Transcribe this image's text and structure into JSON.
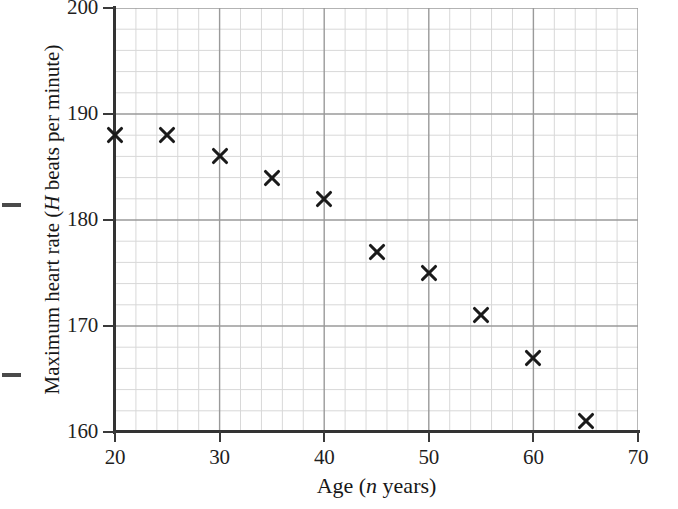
{
  "chart_data": {
    "type": "scatter",
    "title": "",
    "xlabel": "Age (n years)",
    "xlabel_parts": {
      "pre": "Age (",
      "italic": "n",
      "post": " years)"
    },
    "ylabel": "Maximum heart rate (H beats per minute)",
    "ylabel_parts": {
      "pre": "Maximum heart rate (",
      "italic": "H",
      "post": " beats per minute)"
    },
    "xlim": [
      20,
      70
    ],
    "ylim": [
      160,
      200
    ],
    "x_major_ticks": [
      20,
      30,
      40,
      50,
      60,
      70
    ],
    "y_major_ticks": [
      160,
      170,
      180,
      190,
      200
    ],
    "x_minor_step": 2,
    "y_minor_step": 2,
    "grid": true,
    "grid_major_color": "#9a9a9a",
    "grid_minor_color": "#d8d8d8",
    "marker": "x",
    "marker_color": "#1a1a1a",
    "x": [
      20,
      25,
      30,
      35,
      40,
      45,
      50,
      55,
      60,
      65
    ],
    "y": [
      188,
      188,
      186,
      184,
      182,
      177,
      175,
      171,
      167,
      161
    ],
    "points": [
      {
        "n": 20,
        "H": 188
      },
      {
        "n": 25,
        "H": 188
      },
      {
        "n": 30,
        "H": 186
      },
      {
        "n": 35,
        "H": 184
      },
      {
        "n": 40,
        "H": 182
      },
      {
        "n": 45,
        "H": 177
      },
      {
        "n": 50,
        "H": 175
      },
      {
        "n": 55,
        "H": 171
      },
      {
        "n": 60,
        "H": 167
      },
      {
        "n": 65,
        "H": 161
      }
    ],
    "legend": [],
    "legend_position": "none"
  },
  "axes": {
    "x_tick_labels": [
      "20",
      "30",
      "40",
      "50",
      "60",
      "70"
    ],
    "y_tick_labels": [
      "160",
      "170",
      "180",
      "190",
      "200"
    ]
  }
}
